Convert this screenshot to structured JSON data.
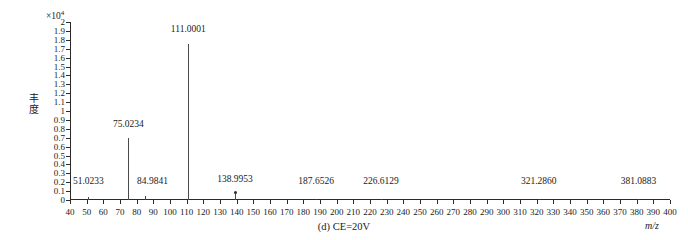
{
  "figure": {
    "caption": "(d) CE=20V",
    "exponent_prefix": "×10",
    "exponent_power": "4",
    "y_axis_title_chars": [
      "丰",
      "度"
    ],
    "x_axis_label": "m/z"
  },
  "chart_data": {
    "type": "bar",
    "title": "(d) CE=20V",
    "xlabel": "m/z",
    "ylabel": "丰度",
    "y_exponent": "×10⁴",
    "xlim": [
      40,
      400
    ],
    "ylim": [
      0,
      2
    ],
    "grid": false,
    "legend": null,
    "x_ticks": [
      40,
      50,
      60,
      70,
      80,
      90,
      100,
      110,
      120,
      130,
      140,
      150,
      160,
      170,
      180,
      190,
      200,
      210,
      220,
      230,
      240,
      250,
      260,
      270,
      280,
      290,
      300,
      310,
      320,
      330,
      340,
      350,
      360,
      370,
      380,
      390,
      400
    ],
    "y_ticks": [
      0,
      0.1,
      0.2,
      0.3,
      0.4,
      0.5,
      0.6,
      0.7,
      0.8,
      0.9,
      1,
      1.1,
      1.2,
      1.3,
      1.4,
      1.5,
      1.6,
      1.7,
      1.8,
      1.9,
      2
    ],
    "y_tick_labels": [
      "0",
      "0.1",
      "0.2",
      "0.3",
      "0.4",
      "0.5",
      "0.6",
      "0.7",
      "0.8",
      "0.9",
      "1",
      "1.1",
      "1.2",
      "1.3",
      "1.4",
      "1.5",
      "1.6",
      "1.7",
      "1.8",
      "1.9",
      "2"
    ],
    "peaks": [
      {
        "mz": 51.0233,
        "label": "51.0233",
        "intensity": 0.03,
        "label_x": 51.0233,
        "label_y": 0.16,
        "marker": false
      },
      {
        "mz": 75.0234,
        "label": "75.0234",
        "intensity": 0.7,
        "label_x": 75.0234,
        "label_y": 0.8,
        "marker": false
      },
      {
        "mz": 84.9841,
        "label": "84.9841",
        "intensity": 0.05,
        "label_x": 89.5,
        "label_y": 0.16,
        "marker": false
      },
      {
        "mz": 111.0001,
        "label": "111.0001",
        "intensity": 1.75,
        "label_x": 111.0001,
        "label_y": 1.87,
        "marker": false
      },
      {
        "mz": 138.9953,
        "label": "138.9953",
        "intensity": 0.07,
        "label_x": 138.9953,
        "label_y": 0.18,
        "marker": true
      },
      {
        "mz": 187.6526,
        "label": "187.6526",
        "intensity": 0.01,
        "label_x": 187.6526,
        "label_y": 0.16,
        "marker": false
      },
      {
        "mz": 226.6129,
        "label": "226.6129",
        "intensity": 0.01,
        "label_x": 226.6129,
        "label_y": 0.16,
        "marker": false
      },
      {
        "mz": 321.286,
        "label": "321.2860",
        "intensity": 0.01,
        "label_x": 321.286,
        "label_y": 0.16,
        "marker": false
      },
      {
        "mz": 381.0883,
        "label": "381.0883",
        "intensity": 0.01,
        "label_x": 381.0883,
        "label_y": 0.16,
        "marker": false
      }
    ]
  },
  "colors": {
    "axis": "#2b2b2b",
    "peak": "#4a4a4a",
    "background": "#ffffff"
  }
}
